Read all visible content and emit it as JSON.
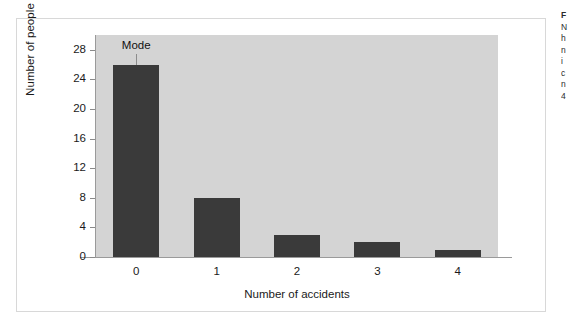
{
  "figure": {
    "frame_present": true,
    "panel_color": "#d4d4d4",
    "bar_color": "#3a3a3a",
    "axis_color": "#9a9a9a",
    "page_background": "#ffffff"
  },
  "annotation": {
    "mode_label": "Mode"
  },
  "caption_sliver": {
    "lines": [
      "F",
      "N",
      "h",
      "n",
      "i",
      "c",
      "n",
      "4"
    ]
  },
  "chart_data": {
    "type": "bar",
    "title": "",
    "categories": [
      "0",
      "1",
      "2",
      "3",
      "4"
    ],
    "values": [
      26,
      8,
      3,
      2,
      1
    ],
    "xlabel": "Number of accidents",
    "ylabel": "Number of people",
    "ylim": [
      0,
      30
    ],
    "yticks": [
      0,
      4,
      8,
      12,
      16,
      20,
      24,
      28
    ],
    "ytick_labels": [
      "0",
      "4",
      "8",
      "12",
      "16",
      "20",
      "24",
      "28"
    ],
    "grid": false,
    "legend": "none",
    "annotations": [
      {
        "text": "Mode",
        "points_to_category": "0",
        "style": "leader-line"
      }
    ]
  }
}
